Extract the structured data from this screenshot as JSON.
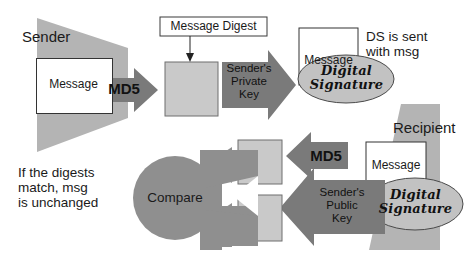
{
  "diagram": {
    "colors": {
      "actor_panel": "#b4b4b4",
      "arrow_dark": "#7a7a7a",
      "digest_box": "#c9c9c9",
      "message_box": "#ffffff",
      "ellipse_fill": "#c2c2c2",
      "outline": "#4a4a4a",
      "text": "#1a1a1a",
      "background": "#ffffff"
    },
    "sender": {
      "label": "Sender",
      "message_box_label": "Message",
      "md5_arrow_label": "MD5",
      "digest_box_label": "",
      "digest_callout_label": "Message Digest",
      "private_key_arrow_label": "Sender's\nPrivate\nKey"
    },
    "transmission": {
      "message_box_label": "Message",
      "signature_ellipse_label": "Digital\nSignature",
      "note": "DS is sent\nwith msg"
    },
    "recipient": {
      "label": "Recipient",
      "message_box_label": "Message",
      "signature_ellipse_label": "Digital\nSignature",
      "md5_arrow_label": "MD5",
      "public_key_arrow_label": "Sender's\nPublic\nKey",
      "compare_label": "Compare",
      "result_note": "If the digests\nmatch, msg\nis unchanged",
      "digest_top_label": "",
      "digest_bottom_label": ""
    }
  }
}
